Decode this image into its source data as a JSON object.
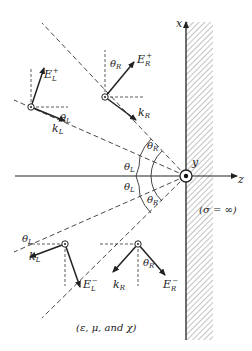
{
  "diagram": {
    "axes": {
      "x_label": "x",
      "y_label": "y",
      "z_label": "z"
    },
    "conductor_label": "(σ = ∞)",
    "medium_label": "(ε, μ, and χ)",
    "angles": {
      "theta_L": "θ",
      "theta_L_sub": "L",
      "theta_R": "θ",
      "theta_R_sub": "R"
    },
    "vectors": {
      "E_L_plus": {
        "base": "E",
        "sub": "L",
        "sup": "+"
      },
      "k_L_upper": {
        "base": "k",
        "sub": "L"
      },
      "E_R_plus": {
        "base": "E",
        "sub": "R",
        "sup": "+"
      },
      "k_R_upper": {
        "base": "k",
        "sub": "R"
      },
      "E_L_minus": {
        "base": "E",
        "sub": "L",
        "sup": "−"
      },
      "k_L_lower": {
        "base": "k",
        "sub": "L"
      },
      "E_R_minus": {
        "base": "E",
        "sub": "R",
        "sup": "−"
      },
      "k_R_lower": {
        "base": "k",
        "sub": "R"
      }
    },
    "colors": {
      "ink": "#222222",
      "hatch": "#555555",
      "background": "#ffffff"
    }
  }
}
